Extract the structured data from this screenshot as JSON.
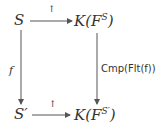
{
  "diagram": {
    "type": "commutative-square",
    "nodes": {
      "top_left": "S",
      "top_right_base": "K(F",
      "top_right_sup": "S",
      "top_right_close": ")",
      "bottom_left": "S′",
      "bottom_right_base": "K(F",
      "bottom_right_sup": "S′",
      "bottom_right_close": ")"
    },
    "arrows": {
      "top": {
        "label": "↑"
      },
      "bottom": {
        "label": "↑"
      },
      "left": {
        "label": "f"
      },
      "right": {
        "label": "Cmp(Flt(f))"
      }
    },
    "colors": {
      "stroke": "#555555",
      "text": "#333333"
    }
  }
}
